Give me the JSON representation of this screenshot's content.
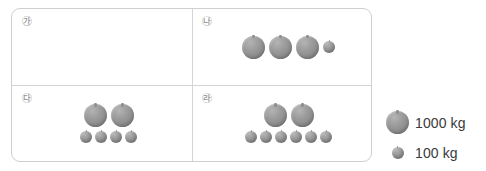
{
  "diagram": {
    "type": "pictogram-weight-comparison",
    "cells": [
      {
        "id": "ga",
        "label": "㉮",
        "large_count": 0,
        "small_count": 0,
        "total_kg": 0,
        "rows": []
      },
      {
        "id": "na",
        "label": "㉯",
        "large_count": 3,
        "small_count": 1,
        "total_kg": 3100,
        "rows": [
          {
            "size": "mixed",
            "large": 3,
            "small": 1
          }
        ]
      },
      {
        "id": "da",
        "label": "㉰",
        "large_count": 2,
        "small_count": 4,
        "total_kg": 2400,
        "rows": [
          {
            "size": "large",
            "large": 2,
            "small": 0
          },
          {
            "size": "small",
            "large": 0,
            "small": 4
          }
        ]
      },
      {
        "id": "ra",
        "label": "㉱",
        "large_count": 2,
        "small_count": 6,
        "total_kg": 2600,
        "rows": [
          {
            "size": "large",
            "large": 2,
            "small": 0
          },
          {
            "size": "small",
            "large": 0,
            "small": 6
          }
        ]
      }
    ]
  },
  "legend": {
    "items": [
      {
        "icon": "large-ball-icon",
        "label": "1000 kg",
        "value": 1000,
        "unit": "kg"
      },
      {
        "icon": "small-ball-icon",
        "label": "100 kg",
        "value": 100,
        "unit": "kg"
      }
    ]
  },
  "colors": {
    "ball_fill": "#9b9b9b",
    "border": "#cfcfcf",
    "divider": "#d4d4d4",
    "label_text": "#8d8d8d",
    "legend_text": "#3a3a3a",
    "background": "#ffffff"
  }
}
